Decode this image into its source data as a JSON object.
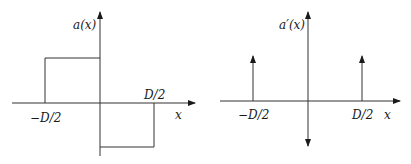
{
  "diagrams": [
    {
      "name": "a-of-x",
      "y_label": "a(x)",
      "x_label": "x",
      "ticks": {
        "left": "−D/2",
        "right": "D/2"
      },
      "description": "Rectangular doublet: +1 from -D/2 to 0, -1 from 0 to D/2"
    },
    {
      "name": "a-prime-of-x",
      "y_label": "a′(x)",
      "x_label": "x",
      "ticks": {
        "left": "−D/2",
        "right": "D/2"
      },
      "description": "Derivative: upward impulses at -D/2 and D/2, downward impulse at 0"
    }
  ],
  "colors": {
    "stroke": "#2a2a2a",
    "text": "#1a1a1a",
    "background": "#ffffff"
  }
}
